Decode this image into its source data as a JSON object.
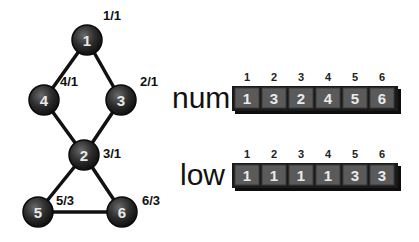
{
  "graph": {
    "nodes": [
      {
        "id": "1",
        "label": "1",
        "annotation": "1/1",
        "x": 87,
        "y": 40,
        "ax": 103,
        "ay": 20
      },
      {
        "id": "4",
        "label": "4",
        "annotation": "4/1",
        "x": 44,
        "y": 100,
        "ax": 60,
        "ay": 86
      },
      {
        "id": "3",
        "label": "3",
        "annotation": "2/1",
        "x": 121,
        "y": 100,
        "ax": 140,
        "ay": 86
      },
      {
        "id": "2",
        "label": "2",
        "annotation": "3/1",
        "x": 84,
        "y": 155,
        "ax": 103,
        "ay": 158
      },
      {
        "id": "5",
        "label": "5",
        "annotation": "5/3",
        "x": 38,
        "y": 212,
        "ax": 56,
        "ay": 205
      },
      {
        "id": "6",
        "label": "6",
        "annotation": "6/3",
        "x": 122,
        "y": 212,
        "ax": 142,
        "ay": 205
      }
    ],
    "edges": [
      [
        "1",
        "4"
      ],
      [
        "1",
        "3"
      ],
      [
        "4",
        "2"
      ],
      [
        "3",
        "2"
      ],
      [
        "2",
        "5"
      ],
      [
        "2",
        "6"
      ],
      [
        "5",
        "6"
      ]
    ]
  },
  "arrays": [
    {
      "name": "num",
      "indices": [
        "1",
        "2",
        "3",
        "4",
        "5",
        "6"
      ],
      "values": [
        "1",
        "3",
        "2",
        "4",
        "5",
        "6"
      ],
      "y": 87,
      "label_x": 172
    },
    {
      "name": "low",
      "indices": [
        "1",
        "2",
        "3",
        "4",
        "5",
        "6"
      ],
      "values": [
        "1",
        "1",
        "1",
        "1",
        "3",
        "3"
      ],
      "y": 164,
      "label_x": 180
    }
  ],
  "colors": {
    "node_fill": "#2b2b2b",
    "edge": "#111111",
    "cell_fill": "#5a5a5a",
    "array_frame": "#1a1a1a"
  }
}
